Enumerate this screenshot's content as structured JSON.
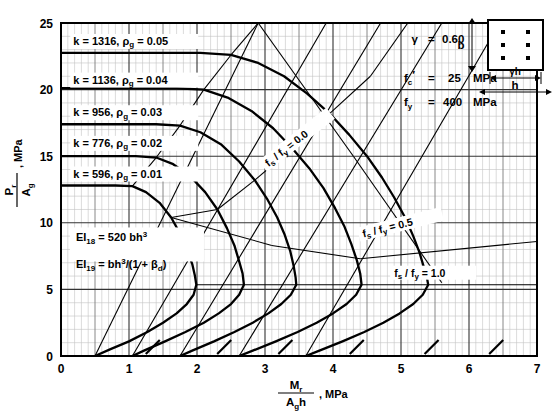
{
  "figure": {
    "title": "",
    "caption_faint": ""
  },
  "axes": {
    "x": {
      "label_num": "M",
      "label_num_sub": "r",
      "label_den": "A",
      "label_den_sub": "g",
      "label_den_tail": "h",
      "label_units": ", MPa",
      "min": 0,
      "max": 7,
      "ticks": [
        "0",
        "1",
        "2",
        "3",
        "4",
        "5",
        "6",
        "7"
      ],
      "tick_values": [
        0,
        1,
        2,
        3,
        4,
        5,
        6,
        7
      ],
      "minor_step": 0.1,
      "mid_step": 0.5
    },
    "y": {
      "label_num": "P",
      "label_num_sub": "r",
      "label_den": "A",
      "label_den_sub": "g",
      "label_units": ", MPa",
      "min": 0,
      "max": 25,
      "ticks": [
        "0",
        "5",
        "10",
        "15",
        "20",
        "25"
      ],
      "tick_values": [
        0,
        5,
        10,
        15,
        20,
        25
      ],
      "minor_step": 1
    }
  },
  "params": {
    "gamma_label": "γ",
    "gamma_eq": "=",
    "gamma_value": "0.60",
    "fc_label": "f",
    "fc_sub": "c",
    "fc_prime": "′",
    "fc_eq": "=",
    "fc_value": "25",
    "fc_units": "MPa",
    "fy_label": "f",
    "fy_sub": "y",
    "fy_eq": "=",
    "fy_value": "400",
    "fy_units": "MPa"
  },
  "section": {
    "b_label": "b",
    "h_label": "h",
    "gamma_h_label": "γh",
    "bar_count": 6,
    "bar_rows": 3,
    "bar_cols": 2
  },
  "equations": {
    "ei18_label": "EI",
    "ei18_sub": "18",
    "ei18_eq": "=",
    "ei18_expr": "520 bh",
    "ei18_exp": "3",
    "ei19_label": "EI",
    "ei19_sub": "19",
    "ei19_eq": "=",
    "ei19_expr_a": "bh",
    "ei19_exp": "3",
    "ei19_expr_b": "/(1 + β",
    "ei19_sub_b": "d",
    "ei19_expr_c": ")"
  },
  "chart_data": {
    "type": "line",
    "xlabel": "Mr / (Ag h), MPa",
    "ylabel": "Pr / Ag, MPa",
    "xlim": [
      0,
      7
    ],
    "ylim": [
      0,
      25
    ],
    "grid": true,
    "legend": "inline-labels",
    "curve_label_prefix_k": "k",
    "curve_label_eq": "=",
    "curve_label_rho": "ρ",
    "curve_label_rho_sub": "g",
    "curves": [
      {
        "name": "rho_g = 0.01",
        "k": "596",
        "k_value": 596,
        "rho_g": "0.01",
        "rho_g_value": 0.01,
        "label_text": "k  =  596,  ρg = 0.01",
        "label_x": 0.18,
        "label_y": 13.4,
        "points": [
          [
            0.0,
            12.8
          ],
          [
            0.35,
            12.8
          ],
          [
            0.8,
            12.8
          ],
          [
            1.05,
            12.75
          ],
          [
            1.25,
            12.3
          ],
          [
            1.45,
            11.5
          ],
          [
            1.62,
            10.4
          ],
          [
            1.75,
            9.2
          ],
          [
            1.85,
            8.0
          ],
          [
            1.93,
            6.9
          ],
          [
            1.97,
            6.0
          ],
          [
            1.99,
            5.35
          ],
          [
            1.95,
            4.6
          ],
          [
            1.85,
            3.9
          ],
          [
            1.7,
            3.2
          ],
          [
            1.5,
            2.5
          ],
          [
            1.27,
            1.8
          ],
          [
            1.0,
            1.1
          ],
          [
            0.72,
            0.5
          ],
          [
            0.5,
            0.0
          ]
        ]
      },
      {
        "name": "rho_g = 0.02",
        "k": "776",
        "k_value": 776,
        "rho_g": "0.02",
        "rho_g_value": 0.02,
        "label_text": "k  =  776,  ρg = 0.02",
        "label_x": 0.18,
        "label_y": 15.7,
        "points": [
          [
            0.0,
            15.0
          ],
          [
            0.5,
            15.0
          ],
          [
            1.1,
            15.0
          ],
          [
            1.4,
            14.9
          ],
          [
            1.65,
            14.4
          ],
          [
            1.9,
            13.5
          ],
          [
            2.12,
            12.3
          ],
          [
            2.3,
            11.0
          ],
          [
            2.44,
            9.6
          ],
          [
            2.55,
            8.3
          ],
          [
            2.62,
            7.1
          ],
          [
            2.67,
            6.2
          ],
          [
            2.69,
            5.35
          ],
          [
            2.62,
            4.6
          ],
          [
            2.5,
            3.9
          ],
          [
            2.32,
            3.2
          ],
          [
            2.1,
            2.5
          ],
          [
            1.83,
            1.8
          ],
          [
            1.53,
            1.1
          ],
          [
            1.22,
            0.4
          ],
          [
            1.05,
            0.0
          ]
        ]
      },
      {
        "name": "rho_g = 0.03",
        "k": "956",
        "k_value": 956,
        "rho_g": "0.03",
        "rho_g_value": 0.03,
        "label_text": "k  =  956,  ρg = 0.03",
        "label_x": 0.18,
        "label_y": 18.0,
        "points": [
          [
            0.0,
            17.4
          ],
          [
            0.6,
            17.4
          ],
          [
            1.4,
            17.4
          ],
          [
            1.75,
            17.3
          ],
          [
            2.05,
            16.8
          ],
          [
            2.35,
            15.9
          ],
          [
            2.62,
            14.6
          ],
          [
            2.85,
            13.2
          ],
          [
            3.03,
            11.8
          ],
          [
            3.18,
            10.4
          ],
          [
            3.29,
            9.1
          ],
          [
            3.37,
            7.9
          ],
          [
            3.42,
            6.8
          ],
          [
            3.45,
            5.9
          ],
          [
            3.46,
            5.35
          ],
          [
            3.38,
            4.6
          ],
          [
            3.24,
            3.9
          ],
          [
            3.05,
            3.2
          ],
          [
            2.82,
            2.5
          ],
          [
            2.55,
            1.8
          ],
          [
            2.25,
            1.1
          ],
          [
            1.93,
            0.4
          ],
          [
            1.75,
            0.0
          ]
        ]
      },
      {
        "name": "rho_g = 0.04",
        "k": "1136",
        "k_value": 1136,
        "rho_g": "0.04",
        "rho_g_value": 0.04,
        "label_text": "k  =  1136,  ρg = 0.04",
        "label_x": 0.18,
        "label_y": 20.45,
        "points": [
          [
            0.0,
            20.1
          ],
          [
            0.8,
            20.1
          ],
          [
            1.7,
            20.1
          ],
          [
            2.1,
            20.0
          ],
          [
            2.45,
            19.4
          ],
          [
            2.8,
            18.4
          ],
          [
            3.12,
            17.1
          ],
          [
            3.4,
            15.6
          ],
          [
            3.65,
            14.1
          ],
          [
            3.86,
            12.6
          ],
          [
            4.03,
            11.1
          ],
          [
            4.17,
            9.7
          ],
          [
            4.27,
            8.4
          ],
          [
            4.35,
            7.2
          ],
          [
            4.4,
            6.2
          ],
          [
            4.42,
            5.35
          ],
          [
            4.34,
            4.6
          ],
          [
            4.2,
            3.9
          ],
          [
            4.0,
            3.2
          ],
          [
            3.76,
            2.5
          ],
          [
            3.48,
            1.8
          ],
          [
            3.16,
            1.1
          ],
          [
            2.82,
            0.4
          ],
          [
            2.62,
            0.0
          ]
        ]
      },
      {
        "name": "rho_g = 0.05",
        "k": "1316",
        "k_value": 1316,
        "rho_g": "0.05",
        "rho_g_value": 0.05,
        "label_text": "k  =  1316,  ρg = 0.05",
        "label_x": 0.18,
        "label_y": 23.35,
        "points": [
          [
            0.0,
            22.75
          ],
          [
            1.0,
            22.75
          ],
          [
            2.05,
            22.75
          ],
          [
            2.5,
            22.6
          ],
          [
            2.9,
            22.0
          ],
          [
            3.28,
            21.0
          ],
          [
            3.62,
            19.7
          ],
          [
            3.95,
            18.2
          ],
          [
            4.24,
            16.6
          ],
          [
            4.5,
            15.0
          ],
          [
            4.72,
            13.4
          ],
          [
            4.9,
            11.9
          ],
          [
            5.06,
            10.4
          ],
          [
            5.18,
            9.0
          ],
          [
            5.27,
            7.8
          ],
          [
            5.34,
            6.6
          ],
          [
            5.38,
            5.9
          ],
          [
            5.4,
            5.35
          ],
          [
            5.32,
            4.6
          ],
          [
            5.18,
            3.9
          ],
          [
            4.98,
            3.2
          ],
          [
            4.74,
            2.5
          ],
          [
            4.46,
            1.8
          ],
          [
            4.14,
            1.1
          ],
          [
            3.8,
            0.4
          ],
          [
            3.6,
            0.0
          ]
        ]
      }
    ],
    "ratio_lines": [
      {
        "name": "fs/fy = 0.0",
        "label": "f",
        "label_sub": "s",
        "label_div": "/ f",
        "label_sub2": "y",
        "label_eq": "=",
        "value": "0.0",
        "value_num": 0.0,
        "label_x": 3.05,
        "label_y": 14.2,
        "segments": [
          [
            [
              1.05,
              12.75
            ],
            [
              1.4,
              14.9
            ]
          ],
          [
            [
              1.4,
              14.9
            ],
            [
              1.75,
              17.3
            ]
          ],
          [
            [
              1.75,
              17.3
            ],
            [
              2.1,
              20.0
            ]
          ],
          [
            [
              2.1,
              20.0
            ],
            [
              2.5,
              22.6
            ]
          ],
          [
            [
              2.5,
              22.6
            ],
            [
              2.9,
              25.0
            ]
          ],
          [
            [
              2.9,
              25.0
            ],
            [
              4.3,
              15.0
            ]
          ],
          [
            [
              4.3,
              15.0
            ],
            [
              5.6,
              5.5
            ]
          ]
        ]
      },
      {
        "name": "fs/fy = 0.5",
        "label": "f",
        "label_sub": "s",
        "label_div": "/ f",
        "label_sub2": "y",
        "label_eq": "=",
        "value": "0.5",
        "value_num": 0.5,
        "label_x": 4.45,
        "label_y": 8.9,
        "segments": [
          [
            [
              1.62,
              10.4
            ],
            [
              2.3,
              11.0
            ]
          ],
          [
            [
              2.3,
              11.0
            ],
            [
              2.85,
              13.2
            ]
          ],
          [
            [
              2.85,
              13.2
            ],
            [
              3.4,
              15.6
            ]
          ],
          [
            [
              3.4,
              15.6
            ],
            [
              3.95,
              18.2
            ]
          ],
          [
            [
              3.95,
              18.2
            ],
            [
              4.55,
              21.0
            ]
          ],
          [
            [
              4.55,
              21.0
            ],
            [
              5.1,
              25.0
            ]
          ],
          [
            [
              1.62,
              10.4
            ],
            [
              3.1,
              8.3
            ]
          ],
          [
            [
              3.1,
              8.3
            ],
            [
              4.4,
              7.3
            ]
          ],
          [
            [
              4.4,
              7.3
            ],
            [
              7.0,
              8.6
            ]
          ]
        ]
      },
      {
        "name": "fs/fy = 1.0",
        "label": "f",
        "label_sub": "s",
        "label_div": "/ f",
        "label_sub2": "y",
        "label_eq": "=",
        "value": "1.0",
        "value_num": 1.0,
        "label_x": 4.9,
        "label_y": 5.95,
        "segments": [
          [
            [
              1.99,
              5.35
            ],
            [
              7.0,
              5.35
            ]
          ]
        ]
      }
    ],
    "lower_diagonals": [
      [
        [
          0.5,
          0.0
        ],
        [
          2.9,
          25.0
        ]
      ],
      [
        [
          1.05,
          0.0
        ],
        [
          3.9,
          25.0
        ]
      ],
      [
        [
          1.75,
          0.0
        ],
        [
          4.7,
          25.0
        ]
      ],
      [
        [
          2.62,
          0.0
        ],
        [
          5.6,
          25.0
        ]
      ],
      [
        [
          3.6,
          0.0
        ],
        [
          6.45,
          25.0
        ]
      ]
    ],
    "tick_diagonals_x": [
      1.35,
      2.4,
      3.3,
      4.35,
      5.45,
      6.4
    ],
    "notes": [
      "EI18 = 520 bh^3",
      "EI19 = bh^3/(1 + betad)"
    ]
  }
}
